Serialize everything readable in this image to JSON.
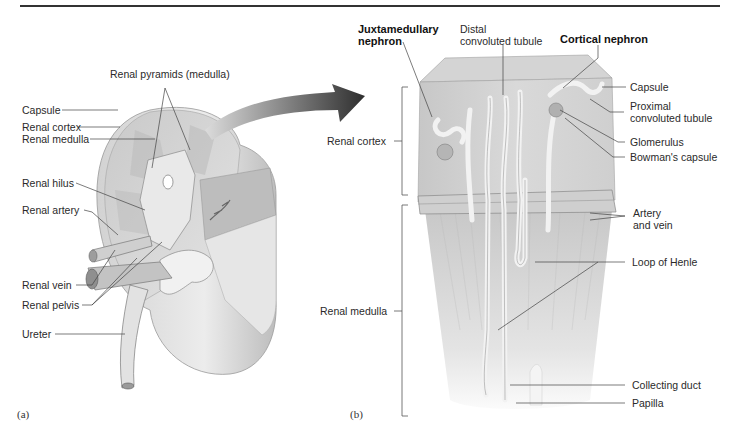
{
  "figure": {
    "panel_a": {
      "tag": "(a)",
      "labels": {
        "renal_pyramids": "Renal pyramids (medulla)",
        "capsule": "Capsule",
        "renal_cortex": "Renal cortex",
        "renal_medulla": "Renal medulla",
        "renal_hilus": "Renal hilus",
        "renal_artery": "Renal artery",
        "renal_vein": "Renal vein",
        "renal_pelvis": "Renal pelvis",
        "ureter": "Ureter"
      }
    },
    "panel_b": {
      "tag": "(b)",
      "labels": {
        "juxtamedullary_1": "Juxtamedullary",
        "juxtamedullary_2": "nephron",
        "distal_1": "Distal",
        "distal_2": "convoluted tubule",
        "cortical_nephron": "Cortical nephron",
        "capsule": "Capsule",
        "proximal_1": "Proximal",
        "proximal_2": "convoluted tubule",
        "glomerulus": "Glomerulus",
        "bowmans_capsule": "Bowman's capsule",
        "renal_cortex": "Renal cortex",
        "artery_vein_1": "Artery",
        "artery_vein_2": "and vein",
        "loop_of_henle": "Loop of Henle",
        "renal_medulla": "Renal medulla",
        "collecting_duct": "Collecting duct",
        "papilla": "Papilla"
      }
    }
  }
}
